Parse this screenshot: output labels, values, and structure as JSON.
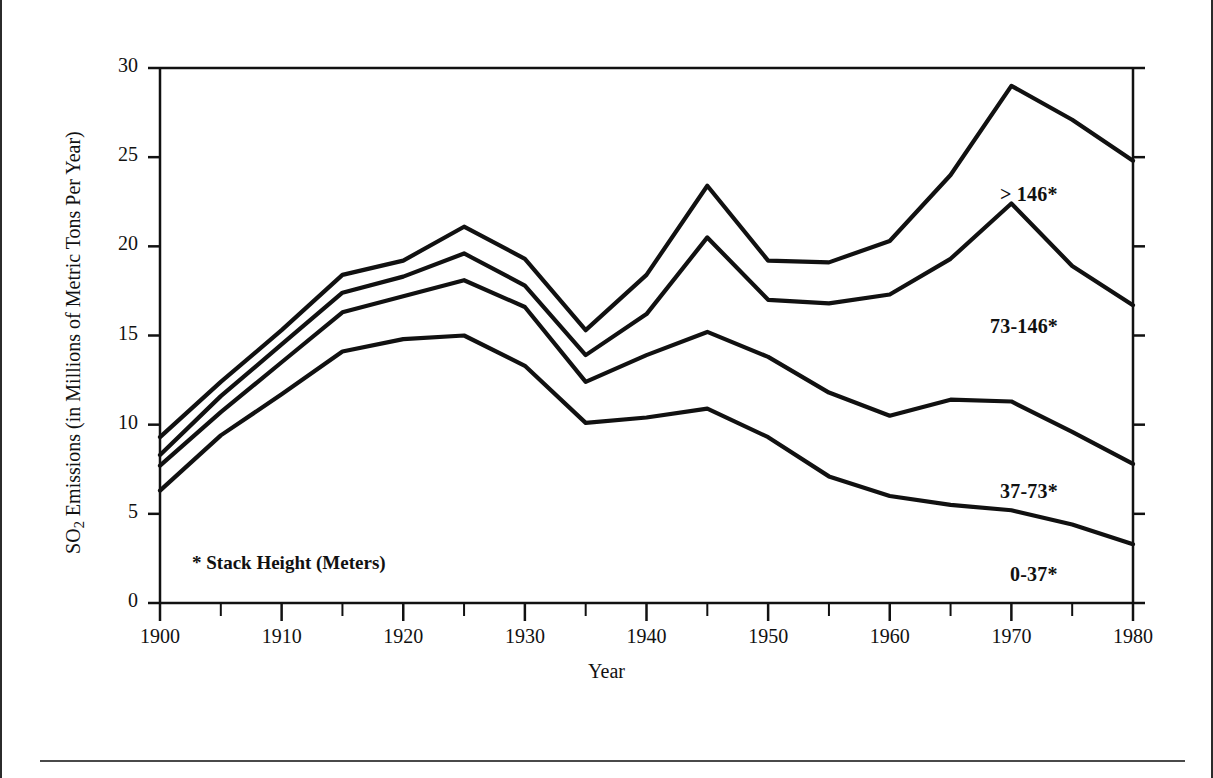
{
  "chart_data": {
    "type": "line",
    "title": "",
    "xlabel": "Year",
    "ylabel": "SO2 Emissions (in Millions of Metric Tons Per Year)",
    "ylabel_parts": {
      "prefix": "SO",
      "sub": "2",
      "suffix": " Emissions (in Millions of Metric Tons Per Year)"
    },
    "footnote": "* Stack Height (Meters)",
    "xlim": [
      1900,
      1980
    ],
    "ylim": [
      0,
      30
    ],
    "grid": false,
    "legend_position": "inline-right",
    "x_major_ticks": [
      1900,
      1910,
      1920,
      1930,
      1940,
      1950,
      1960,
      1970,
      1980
    ],
    "x_minor_ticks": [
      1905,
      1915,
      1925,
      1935,
      1945,
      1955,
      1965,
      1975
    ],
    "x_tick_labels": [
      "1900",
      "1910",
      "1920",
      "1930",
      "1940",
      "1950",
      "1960",
      "1970",
      "1980"
    ],
    "y_major_ticks": [
      0,
      5,
      10,
      15,
      20,
      25,
      30
    ],
    "y_tick_labels": [
      "0",
      "5",
      "10",
      "15",
      "20",
      "25",
      "30"
    ],
    "x": [
      1900,
      1905,
      1910,
      1915,
      1920,
      1925,
      1930,
      1935,
      1940,
      1945,
      1950,
      1955,
      1960,
      1965,
      1970,
      1975,
      1980
    ],
    "series": [
      {
        "name": "> 146*",
        "label": "> 146*",
        "color": "#111111",
        "values": [
          9.3,
          12.4,
          15.3,
          18.4,
          19.2,
          21.1,
          19.3,
          15.3,
          18.4,
          23.4,
          19.2,
          19.1,
          20.3,
          24.0,
          29.0,
          27.1,
          24.8
        ]
      },
      {
        "name": "73-146*",
        "label": "73-146*",
        "color": "#111111",
        "values": [
          8.3,
          11.6,
          14.5,
          17.4,
          18.3,
          19.6,
          17.8,
          13.9,
          16.2,
          20.5,
          17.0,
          16.8,
          17.3,
          19.3,
          22.4,
          18.9,
          16.7
        ]
      },
      {
        "name": "37-73*",
        "label": "37-73*",
        "color": "#111111",
        "values": [
          7.7,
          10.7,
          13.5,
          16.3,
          17.2,
          18.1,
          16.6,
          12.4,
          13.9,
          15.2,
          13.8,
          11.8,
          10.5,
          11.4,
          11.3,
          9.6,
          7.8
        ]
      },
      {
        "name": "0-37*",
        "label": "0-37*",
        "color": "#111111",
        "values": [
          6.3,
          9.4,
          11.7,
          14.1,
          14.8,
          15.0,
          13.3,
          10.1,
          10.4,
          10.9,
          9.3,
          7.1,
          6.0,
          5.5,
          5.2,
          4.4,
          3.3
        ]
      }
    ],
    "series_label_positions": [
      {
        "label": "> 146*",
        "x_px": 1000,
        "y_px": 183
      },
      {
        "label": "73-146*",
        "x_px": 990,
        "y_px": 315
      },
      {
        "label": "37-73*",
        "x_px": 1000,
        "y_px": 480
      },
      {
        "label": "0-37*",
        "x_px": 1010,
        "y_px": 563
      }
    ]
  }
}
